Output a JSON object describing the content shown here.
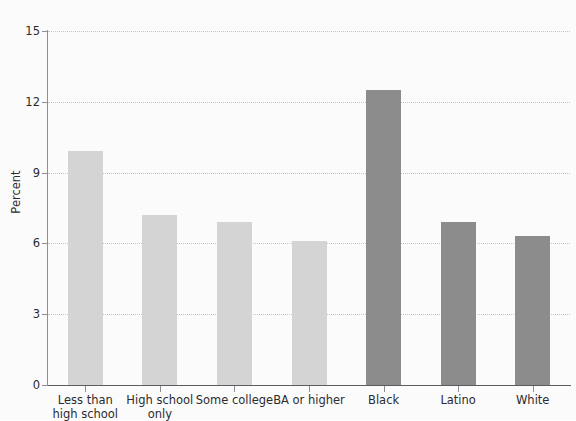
{
  "chart_data": {
    "type": "bar",
    "title": "",
    "xlabel": "",
    "ylabel": "Percent",
    "ylim": [
      0,
      15
    ],
    "yticks": [
      0,
      3,
      6,
      9,
      12,
      15
    ],
    "ytick_labels": [
      "0",
      "3",
      "6",
      "9",
      "12",
      "15"
    ],
    "grid": true,
    "legend": "none",
    "categories": [
      "Less than\nhigh school",
      "High school\nonly",
      "Some college",
      "BA or higher",
      "Black",
      "Latino",
      "White"
    ],
    "values": [
      9.9,
      7.2,
      6.9,
      6.1,
      12.5,
      6.9,
      6.3
    ],
    "bar_colors": [
      "#d4d4d4",
      "#d4d4d4",
      "#d4d4d4",
      "#d4d4d4",
      "#8c8c8c",
      "#8c8c8c",
      "#8c8c8c"
    ],
    "groups": [
      {
        "name": "Education",
        "color": "#d4d4d4",
        "categories": [
          "Less than high school",
          "High school only",
          "Some college",
          "BA or higher"
        ]
      },
      {
        "name": "Race and ethnicity",
        "color": "#8c8c8c",
        "categories": [
          "Black",
          "Latino",
          "White"
        ]
      }
    ]
  },
  "figure": {
    "background": "#fbfbfb",
    "gridline_color": "#c6c6d0",
    "axis_color": "#5c5c62",
    "text_color": "#2b2b2f"
  }
}
